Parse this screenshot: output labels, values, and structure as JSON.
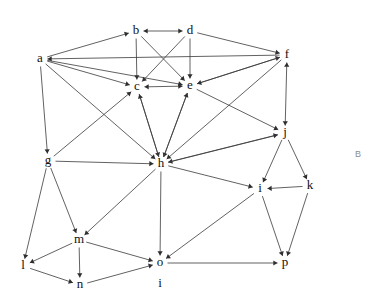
{
  "figure": {
    "type": "directed-graph",
    "width": 381,
    "height": 301,
    "background_color": "#ffffff",
    "edge_color": "#3a3a3a",
    "label_color": "#111111",
    "corner_mark": "B",
    "corner_mark_color": "#8d8d8d",
    "stray_label": "i"
  },
  "nodes": [
    {
      "id": "a",
      "label": "a",
      "x": 40,
      "y": 59
    },
    {
      "id": "b",
      "label": "b",
      "x": 136,
      "y": 31
    },
    {
      "id": "c",
      "label": "c",
      "x": 137,
      "y": 87
    },
    {
      "id": "d",
      "label": "d",
      "x": 190,
      "y": 31
    },
    {
      "id": "e",
      "label": "e",
      "x": 190,
      "y": 86
    },
    {
      "id": "f",
      "label": "f",
      "x": 287,
      "y": 55
    },
    {
      "id": "g",
      "label": "g",
      "x": 48,
      "y": 161
    },
    {
      "id": "h",
      "label": "h",
      "x": 161,
      "y": 164
    },
    {
      "id": "j",
      "label": "j",
      "x": 285,
      "y": 133
    },
    {
      "id": "k",
      "label": "k",
      "x": 310,
      "y": 186
    },
    {
      "id": "l",
      "label": "l",
      "x": 23,
      "y": 266
    },
    {
      "id": "m",
      "label": "m",
      "x": 79,
      "y": 240
    },
    {
      "id": "n",
      "label": "n",
      "x": 80,
      "y": 285
    },
    {
      "id": "o",
      "label": "o",
      "x": 160,
      "y": 263
    },
    {
      "id": "p",
      "label": "p",
      "x": 285,
      "y": 263
    },
    {
      "id": "i",
      "label": "i",
      "x": 260,
      "y": 189
    }
  ],
  "stray_labels": [
    {
      "text": "i",
      "x": 160,
      "y": 284
    }
  ],
  "edges": [
    {
      "from": "a",
      "to": "b",
      "directed": "forward"
    },
    {
      "from": "b",
      "to": "d",
      "directed": "both"
    },
    {
      "from": "d",
      "to": "f",
      "directed": "forward"
    },
    {
      "from": "f",
      "to": "a",
      "directed": "forward"
    },
    {
      "from": "b",
      "to": "c",
      "directed": "forward"
    },
    {
      "from": "b",
      "to": "e",
      "directed": "forward"
    },
    {
      "from": "d",
      "to": "c",
      "directed": "forward"
    },
    {
      "from": "d",
      "to": "e",
      "directed": "forward"
    },
    {
      "from": "a",
      "to": "c",
      "directed": "forward"
    },
    {
      "from": "a",
      "to": "e",
      "directed": "forward"
    },
    {
      "from": "c",
      "to": "e",
      "directed": "both"
    },
    {
      "from": "e",
      "to": "f",
      "directed": "forward"
    },
    {
      "from": "f",
      "to": "e",
      "directed": "forward"
    },
    {
      "from": "a",
      "to": "g",
      "directed": "forward"
    },
    {
      "from": "a",
      "to": "h",
      "directed": "forward"
    },
    {
      "from": "c",
      "to": "h",
      "directed": "forward"
    },
    {
      "from": "e",
      "to": "h",
      "directed": "forward"
    },
    {
      "from": "g",
      "to": "c",
      "directed": "forward"
    },
    {
      "from": "h",
      "to": "c",
      "directed": "forward"
    },
    {
      "from": "h",
      "to": "e",
      "directed": "forward"
    },
    {
      "from": "e",
      "to": "j",
      "directed": "forward"
    },
    {
      "from": "f",
      "to": "h",
      "directed": "forward"
    },
    {
      "from": "f",
      "to": "j",
      "directed": "both"
    },
    {
      "from": "g",
      "to": "h",
      "directed": "forward"
    },
    {
      "from": "j",
      "to": "h",
      "directed": "forward"
    },
    {
      "from": "h",
      "to": "j",
      "directed": "forward"
    },
    {
      "from": "g",
      "to": "l",
      "directed": "forward"
    },
    {
      "from": "g",
      "to": "m",
      "directed": "forward"
    },
    {
      "from": "h",
      "to": "m",
      "directed": "forward"
    },
    {
      "from": "h",
      "to": "o",
      "directed": "forward"
    },
    {
      "from": "h",
      "to": "i",
      "directed": "forward"
    },
    {
      "from": "j",
      "to": "i",
      "directed": "forward"
    },
    {
      "from": "j",
      "to": "k",
      "directed": "forward"
    },
    {
      "from": "k",
      "to": "i",
      "directed": "forward"
    },
    {
      "from": "k",
      "to": "p",
      "directed": "forward"
    },
    {
      "from": "i",
      "to": "p",
      "directed": "forward"
    },
    {
      "from": "i",
      "to": "o",
      "directed": "forward"
    },
    {
      "from": "o",
      "to": "p",
      "directed": "forward"
    },
    {
      "from": "m",
      "to": "l",
      "directed": "forward"
    },
    {
      "from": "m",
      "to": "n",
      "directed": "forward"
    },
    {
      "from": "l",
      "to": "n",
      "directed": "forward"
    },
    {
      "from": "n",
      "to": "o",
      "directed": "forward"
    },
    {
      "from": "m",
      "to": "o",
      "directed": "forward"
    }
  ]
}
